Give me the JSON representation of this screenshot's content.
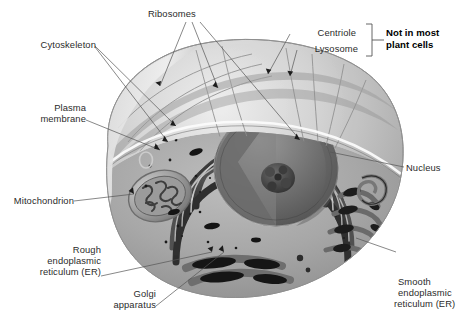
{
  "figure": {
    "background_color": "#ffffff",
    "label_color": "#2b2b2b",
    "leader_color": "#555555"
  },
  "labels": {
    "ribosomes": "Ribosomes",
    "cytoskeleton": "Cytoskeleton",
    "plasma_membrane_line1": "Plasma",
    "plasma_membrane_line2": "membrane",
    "mitochondrion": "Mitochondrion",
    "rough_er_line1": "Rough",
    "rough_er_line2": "endoplasmic",
    "rough_er_line3": "reticulum (ER)",
    "golgi_line1": "Golgi",
    "golgi_line2": "apparatus",
    "centriole": "Centriole",
    "lysosome": "Lysosome",
    "note_line1": "Not in most",
    "note_line2": "plant cells",
    "nucleus": "Nucleus",
    "smooth_er_line1": "Smooth",
    "smooth_er_line2": "endoplasmic",
    "smooth_er_line3": "reticulum (ER)"
  },
  "structures": {
    "cell_body": "animal-cell-body",
    "nucleus": "nucleus-sphere",
    "nucleolus": "nucleolus",
    "mitochondrion": "mitochondrion",
    "golgi": "golgi-apparatus",
    "rough_er": "rough-endoplasmic-reticulum",
    "smooth_er": "smooth-endoplasmic-reticulum",
    "lysosome": "lysosome",
    "centriole": "centriole",
    "ribosome_dots": "free-ribosomes",
    "cytoskeleton_fibers": "cytoskeleton-filaments",
    "plasma_membrane": "plasma-membrane-edge"
  },
  "colors": {
    "membrane_light": "#d8d8d8",
    "membrane_mid": "#b6b6b6",
    "cytoplasm": "#a9a9a9",
    "cytoplasm_light": "#c4c4c4",
    "organelle_dark": "#3a3a3a",
    "organelle_mid": "#6e6e6e",
    "nucleus_fill": "#7a7a7a",
    "highlight": "#f2f2f2"
  }
}
